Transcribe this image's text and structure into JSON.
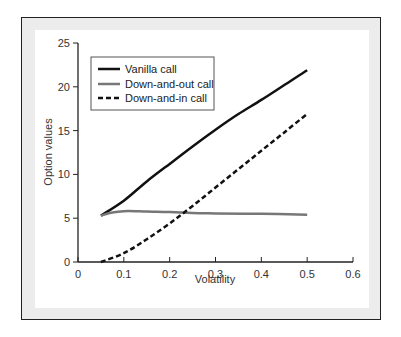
{
  "chart_data": {
    "type": "line",
    "title": "",
    "xlabel": "Volatility",
    "ylabel": "Option values",
    "xlim": [
      0,
      0.6
    ],
    "ylim": [
      0,
      25
    ],
    "xticks": [
      0,
      0.1,
      0.2,
      0.3,
      0.4,
      0.5,
      0.6
    ],
    "xtick_labels": [
      "0",
      "0.1",
      "0.2",
      "0.3",
      "0.4",
      "0.5",
      "0.6"
    ],
    "yticks": [
      0,
      5,
      10,
      15,
      20,
      25
    ],
    "ytick_labels": [
      "0",
      "5",
      "10",
      "15",
      "20",
      "25"
    ],
    "grid": false,
    "legend_position": "upper left",
    "series": [
      {
        "name": "Vanilla call",
        "style": "solid",
        "color": "#111111",
        "x": [
          0.05,
          0.1,
          0.15,
          0.2,
          0.25,
          0.3,
          0.35,
          0.4,
          0.45,
          0.5
        ],
        "values": [
          5.3,
          7.0,
          9.2,
          11.2,
          13.2,
          15.1,
          16.9,
          18.5,
          20.2,
          21.9
        ]
      },
      {
        "name": "Down-and-out call",
        "style": "solid",
        "color": "#777777",
        "x": [
          0.05,
          0.075,
          0.1,
          0.125,
          0.15,
          0.2,
          0.25,
          0.3,
          0.4,
          0.5
        ],
        "values": [
          5.3,
          5.65,
          5.8,
          5.8,
          5.75,
          5.7,
          5.6,
          5.55,
          5.5,
          5.4
        ]
      },
      {
        "name": "Down-and-in call",
        "style": "dashed",
        "color": "#111111",
        "x": [
          0.05,
          0.1,
          0.15,
          0.2,
          0.25,
          0.3,
          0.35,
          0.4,
          0.45,
          0.5
        ],
        "values": [
          0.0,
          1.0,
          2.6,
          4.4,
          6.4,
          8.5,
          10.6,
          12.7,
          14.8,
          16.9
        ]
      }
    ]
  },
  "legend": {
    "items": [
      {
        "label": "Vanilla call"
      },
      {
        "label": "Down-and-out call"
      },
      {
        "label": "Down-and-in call"
      }
    ]
  },
  "axes": {
    "x_label": "Volatility",
    "y_label": "Option values"
  }
}
